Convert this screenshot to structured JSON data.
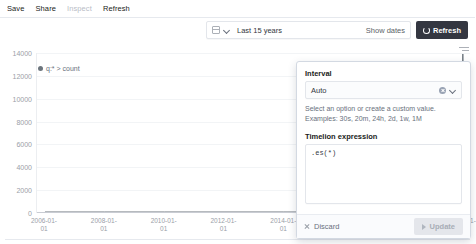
{
  "topbar": {
    "items": [
      {
        "label": "Save",
        "disabled": false
      },
      {
        "label": "Share",
        "disabled": false
      },
      {
        "label": "Inspect",
        "disabled": true
      },
      {
        "label": "Refresh",
        "disabled": false
      }
    ]
  },
  "querybar": {
    "calendar_icon": "calendar-icon",
    "chevron_icon": "chevron-down-icon",
    "date_range": "Last 15 years",
    "show_dates": "Show dates",
    "refresh_label": "Refresh",
    "refresh_icon": "refresh-icon",
    "refresh_bg": "#343741"
  },
  "chart_panel": {
    "legend_toggle_icon": "legend-list-icon",
    "legend_label": "q:* > count",
    "legend_color": "#6c757d"
  },
  "chart_data": {
    "type": "line",
    "title": "",
    "xlabel": "",
    "ylabel": "",
    "ylim": [
      0,
      14000
    ],
    "yticks": [
      0,
      2000,
      4000,
      6000,
      8000,
      10000,
      12000,
      14000
    ],
    "ytick_labels": [
      "0",
      "2000",
      "4000",
      "6000",
      "8000",
      "10000",
      "12000",
      "14000"
    ],
    "grid": true,
    "legend_position": "top-left",
    "series": [
      {
        "name": "q:* > count",
        "color": "#6c757d",
        "x": [
          "2006-01-01",
          "2008-01-01",
          "2010-01-01",
          "2012-01-01",
          "2014-01-01",
          "2016-01-01",
          "2018-01-01",
          "2019-01-01",
          "2019-07-01",
          "2019-10-01",
          "2019-12-01",
          "2020-01-01",
          "2020-02-01",
          "2020-04-01"
        ],
        "values": [
          0,
          0,
          0,
          0,
          0,
          0,
          0,
          0,
          0,
          0,
          300,
          14200,
          900,
          0
        ]
      }
    ],
    "xticks": [
      {
        "line1": "2006-01-",
        "line2": "01"
      },
      {
        "line1": "2008-01-",
        "line2": "01"
      },
      {
        "line1": "2010-01-",
        "line2": "01"
      },
      {
        "line1": "2012-01-",
        "line2": "01"
      },
      {
        "line1": "2014-01-",
        "line2": "01"
      },
      {
        "line1": "2016-01-",
        "line2": "01"
      },
      {
        "line1": "2018-01-",
        "line2": "01"
      },
      {
        "line1": "2020-01-",
        "line2": "01"
      }
    ]
  },
  "popover": {
    "interval_label": "Interval",
    "interval_value": "Auto",
    "clear_icon": "clear-circle-icon",
    "chevron_icon": "chevron-down-icon",
    "help_text": "Select an option or create a custom value. Examples: 30s, 20m, 24h, 2d, 1w, 1M",
    "expression_label": "Timelion expression",
    "expression_value": ".es(*)",
    "discard_label": "Discard",
    "discard_icon": "close-icon",
    "update_label": "Update",
    "update_icon": "play-icon"
  }
}
